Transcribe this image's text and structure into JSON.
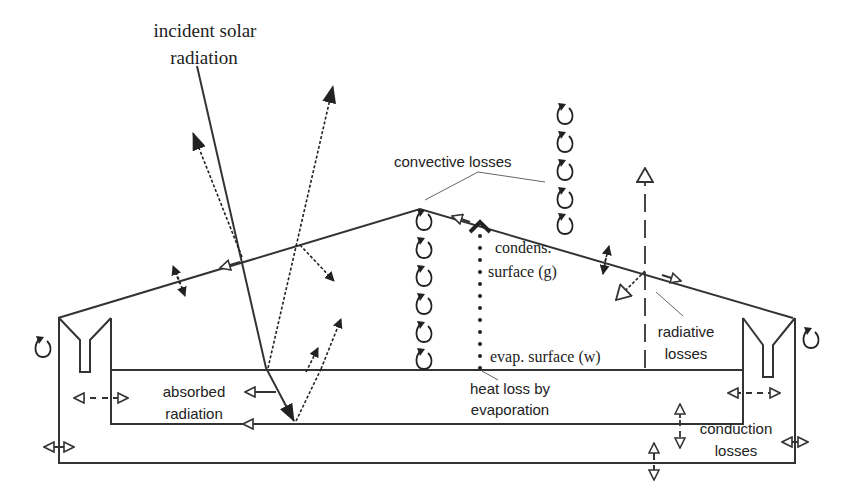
{
  "diagram": {
    "labels": {
      "incident_line1": "incident solar",
      "incident_line2": "radiation",
      "convective": "convective losses",
      "condens_line1": "condens.",
      "condens_line2": "surface (g)",
      "evap_surface": "evap. surface (w)",
      "heat_loss_line1": "heat loss by",
      "heat_loss_line2": "evaporation",
      "absorbed_line1": "absorbed",
      "absorbed_line2": "radiation",
      "radiative_line1": "radiative",
      "radiative_line2": "losses",
      "conduction_line1": "conduction",
      "conduction_line2": "losses"
    },
    "components": [
      "glass cover",
      "basin water",
      "basin liner",
      "insulated outer casing",
      "condensate gutter left",
      "condensate gutter right"
    ],
    "flows": [
      "incident solar radiation",
      "reflected radiation",
      "absorbed radiation",
      "convective losses",
      "radiative losses",
      "evaporation heat loss",
      "conduction losses"
    ]
  }
}
